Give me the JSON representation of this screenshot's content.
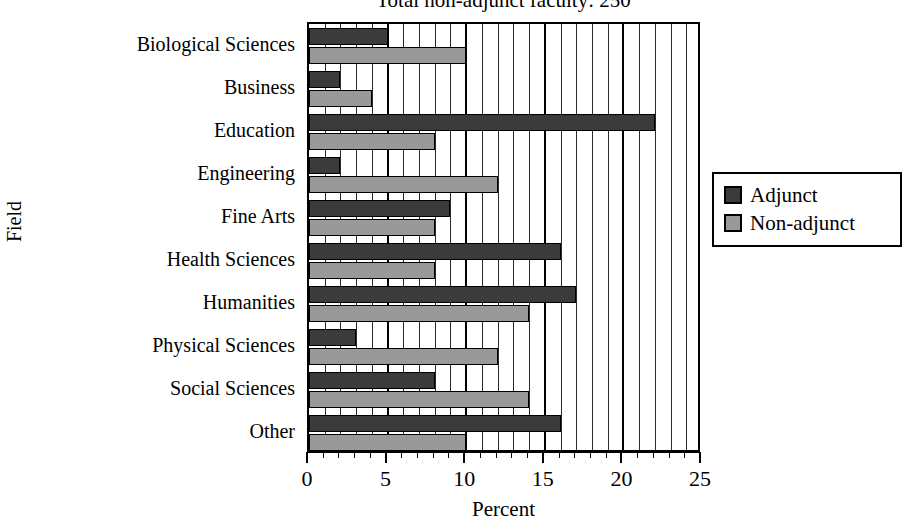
{
  "chart_data": {
    "type": "bar",
    "orientation": "horizontal",
    "title": "Total non-adjunct faculty: 250",
    "xlabel": "Percent",
    "ylabel": "Field",
    "xlim": [
      0,
      25
    ],
    "xticks": [
      "0",
      "5",
      "10",
      "15",
      "20",
      "25"
    ],
    "grid": true,
    "grid_minor_step": 1,
    "grid_major_step": 5,
    "legend_position": "right",
    "categories": [
      "Biological Sciences",
      "Business",
      "Education",
      "Engineering",
      "Fine Arts",
      "Health Sciences",
      "Humanities",
      "Physical Sciences",
      "Social Sciences",
      "Other"
    ],
    "series": [
      {
        "name": "Adjunct",
        "color": "#3b3b3b",
        "values": [
          5,
          2,
          22,
          2,
          9,
          16,
          17,
          3,
          8,
          16
        ]
      },
      {
        "name": "Non-adjunct",
        "color": "#999999",
        "values": [
          10,
          4,
          8,
          12,
          8,
          8,
          14,
          12,
          14,
          10
        ]
      }
    ]
  },
  "legend": {
    "items": [
      {
        "label": "Adjunct",
        "swatch": "adjunct"
      },
      {
        "label": "Non-adjunct",
        "swatch": "nonadjunct"
      }
    ]
  }
}
